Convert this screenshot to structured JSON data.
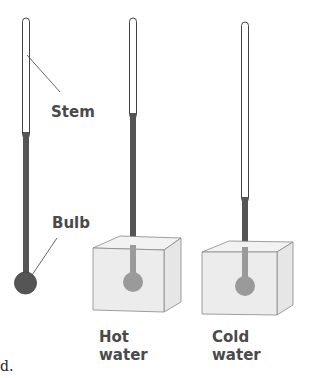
{
  "figure": {
    "labels": {
      "stem": "Stem",
      "bulb": "Bulb",
      "hot_line1": "Hot",
      "hot_line2": "water",
      "cold_line1": "Cold",
      "cold_line2": "water",
      "caption_fragment": "d."
    },
    "thermometers": [
      {
        "id": "reference",
        "liquid_top_y": 132
      },
      {
        "id": "hot-water",
        "liquid_top_y": 113
      },
      {
        "id": "cold-water",
        "liquid_top_y": 197
      }
    ],
    "colors": {
      "liquid": "#555555",
      "bulb_submerged": "#9a9a9a",
      "cube_face": "#ececec",
      "cube_edge": "#888888",
      "label": "#4a4a4a"
    }
  }
}
